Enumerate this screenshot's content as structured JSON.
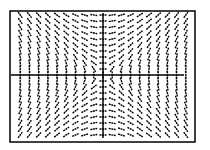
{
  "chart_data": {
    "type": "slope_field",
    "title": "",
    "equation": "dy/dx = x/y",
    "xlabel": "",
    "ylabel": "",
    "grid": false,
    "legend": "none",
    "xlim": [
      -10,
      10
    ],
    "ylim": [
      -10,
      10
    ],
    "x": [
      -9.5,
      -8.5,
      -7.5,
      -6.5,
      -5.5,
      -4.5,
      -3.5,
      -2.5,
      -1.5,
      -0.5,
      0,
      0.5,
      1.5,
      2.5,
      3.5,
      4.5,
      5.5,
      6.5,
      7.5,
      8.5,
      9.5
    ],
    "y_rows": 21
  },
  "plot": {
    "frame": {
      "left": 10,
      "top": 11,
      "right": 195,
      "bottom": 142
    },
    "origin_px": {
      "x": 103,
      "y": 75
    },
    "axis_x": {
      "x1": 11,
      "x2": 184
    },
    "axis_y": {
      "y1": 13,
      "y2": 138
    },
    "cols": 19,
    "rows": 21,
    "col_spacing": 9.2,
    "row_spacing": 6.0,
    "seg_len": 7,
    "stroke_color": "#000000",
    "background_color": "#ffffff"
  }
}
